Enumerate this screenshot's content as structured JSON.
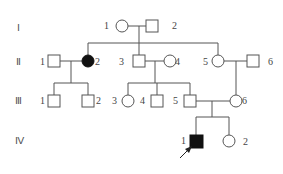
{
  "diagram": {
    "type": "pedigree",
    "generations": [
      {
        "label": "Ⅰ",
        "y": 28
      },
      {
        "label": "Ⅱ",
        "y": 62
      },
      {
        "label": "Ⅲ",
        "y": 101
      },
      {
        "label": "Ⅳ",
        "y": 141
      }
    ],
    "individuals": [
      {
        "id": "I-1",
        "num": "1",
        "sex": "female",
        "affected": false
      },
      {
        "id": "I-2",
        "num": "2",
        "sex": "male",
        "affected": false
      },
      {
        "id": "II-1",
        "num": "1",
        "sex": "male",
        "affected": false
      },
      {
        "id": "II-2",
        "num": "2",
        "sex": "female",
        "affected": true
      },
      {
        "id": "II-3",
        "num": "3",
        "sex": "male",
        "affected": false
      },
      {
        "id": "II-4",
        "num": "4",
        "sex": "female",
        "affected": false
      },
      {
        "id": "II-5",
        "num": "5",
        "sex": "female",
        "affected": false
      },
      {
        "id": "II-6",
        "num": "6",
        "sex": "male",
        "affected": false
      },
      {
        "id": "III-1",
        "num": "1",
        "sex": "male",
        "affected": false
      },
      {
        "id": "III-2",
        "num": "2",
        "sex": "male",
        "affected": false
      },
      {
        "id": "III-3",
        "num": "3",
        "sex": "female",
        "affected": false
      },
      {
        "id": "III-4",
        "num": "4",
        "sex": "male",
        "affected": false
      },
      {
        "id": "III-5",
        "num": "5",
        "sex": "male",
        "affected": false
      },
      {
        "id": "III-6",
        "num": "6",
        "sex": "female",
        "affected": false
      },
      {
        "id": "IV-1",
        "num": "1",
        "sex": "male",
        "affected": true,
        "proband": true
      },
      {
        "id": "IV-2",
        "num": "2",
        "sex": "female",
        "affected": false
      }
    ]
  }
}
